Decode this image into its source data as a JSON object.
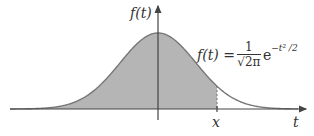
{
  "diagram": {
    "y_axis_label": "f(t)",
    "x_axis_label": "t",
    "marker_label": "x",
    "formula": {
      "lhs": "f(t) =",
      "numerator": "1",
      "denominator": "√2π",
      "base": "e",
      "exponent": "−t² /2"
    },
    "colors": {
      "curve": "#777777",
      "fill": "#b5b5b5",
      "axis": "#444444",
      "text": "#333333"
    }
  }
}
